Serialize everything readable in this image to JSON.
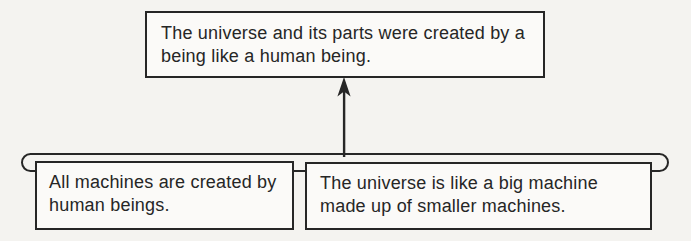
{
  "canvas": {
    "width": 691,
    "height": 241
  },
  "colors": {
    "page_background": "#f4f3f0",
    "box_background": "#fbfaf8",
    "line": "#262626",
    "text": "#262626"
  },
  "diagram": {
    "type": "argument-structure",
    "conclusion_box": {
      "text": "The universe and its parts were created by a being like a human being."
    },
    "premise_boxes": [
      {
        "text": "All machines are created by human beings."
      },
      {
        "text": "The universe is like a big machine made up of smaller machines."
      }
    ],
    "connector": {
      "arrow_direction": "up",
      "joined_premises": true
    }
  }
}
